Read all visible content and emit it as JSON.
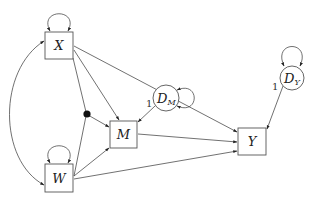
{
  "diagram": {
    "type": "path-diagram",
    "nodes": [
      {
        "id": "X",
        "label": "X",
        "shape": "box",
        "kind": "observed"
      },
      {
        "id": "W",
        "label": "W",
        "shape": "box",
        "kind": "observed"
      },
      {
        "id": "M",
        "label": "M",
        "shape": "box",
        "kind": "observed"
      },
      {
        "id": "Y",
        "label": "Y",
        "shape": "box",
        "kind": "observed"
      },
      {
        "id": "DM",
        "label": "D",
        "subscript": "M",
        "shape": "circle",
        "kind": "disturbance"
      },
      {
        "id": "DY",
        "label": "D",
        "subscript": "Y",
        "shape": "circle",
        "kind": "disturbance"
      },
      {
        "id": "XW",
        "label": "",
        "shape": "dot",
        "kind": "interaction"
      }
    ],
    "edges": [
      {
        "from": "X",
        "to": "M",
        "type": "directed"
      },
      {
        "from": "X",
        "to": "Y",
        "type": "directed"
      },
      {
        "from": "X",
        "to": "XW",
        "type": "line"
      },
      {
        "from": "W",
        "to": "XW",
        "type": "line"
      },
      {
        "from": "XW",
        "to": "M",
        "type": "directed"
      },
      {
        "from": "W",
        "to": "M",
        "type": "directed"
      },
      {
        "from": "W",
        "to": "Y",
        "type": "directed"
      },
      {
        "from": "M",
        "to": "Y",
        "type": "directed"
      },
      {
        "from": "DM",
        "to": "M",
        "type": "directed",
        "label": "1"
      },
      {
        "from": "DY",
        "to": "Y",
        "type": "directed",
        "label": "1"
      },
      {
        "from": "X",
        "to": "W",
        "type": "covariance"
      },
      {
        "from": "X",
        "to": "X",
        "type": "variance"
      },
      {
        "from": "W",
        "to": "W",
        "type": "variance"
      },
      {
        "from": "DM",
        "to": "DM",
        "type": "variance"
      },
      {
        "from": "DY",
        "to": "DY",
        "type": "variance"
      }
    ],
    "labels": {
      "x": "X",
      "w": "W",
      "m": "M",
      "y": "Y",
      "dm_main": "D",
      "dm_sub": "M",
      "dy_main": "D",
      "dy_sub": "Y",
      "dm_coef": "1",
      "dy_coef": "1"
    }
  }
}
